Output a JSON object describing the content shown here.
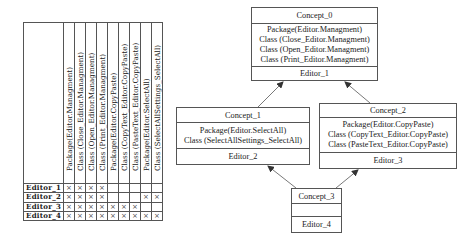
{
  "context_table": {
    "attributes": [
      "Package(Editor.Managment)",
      "Class (Close_Editor.Managment)",
      "Class (Open_Editor.Managment)",
      "Class (Print_Editor.Managment)",
      "Package(Editor.CopyPaste)",
      "Class (CopyText_Editor.CopyPaste)",
      "Class (PasteText_Editor.CopyPaste)",
      "Package(Editor.SelectAll)",
      "Class (SelectAllSettings_SelectAll)"
    ],
    "mark": "×",
    "rows": [
      {
        "object": "Editor_1",
        "cells": [
          "×",
          "×",
          "×",
          "×",
          "",
          "",
          "",
          "",
          ""
        ]
      },
      {
        "object": "Editor_2",
        "cells": [
          "×",
          "×",
          "×",
          "×",
          "",
          "",
          "",
          "×",
          "×"
        ]
      },
      {
        "object": "Editor_3",
        "cells": [
          "×",
          "×",
          "×",
          "×",
          "×",
          "×",
          "×",
          "",
          ""
        ]
      },
      {
        "object": "Editor_4",
        "cells": [
          "×",
          "×",
          "×",
          "×",
          "×",
          "×",
          "×",
          "×",
          "×"
        ]
      }
    ]
  },
  "lattice": {
    "concepts": [
      {
        "name": "Concept_0",
        "attributes": [
          "Package(Editor.Managment)",
          "Class (Close_Editor.Managment)",
          "Class (Open_Editor.Managment)",
          "Class (Print_Editor.Managment)"
        ],
        "objects": "Editor_1"
      },
      {
        "name": "Concept_1",
        "attributes": [
          "Package(Editor.SelectAll)",
          "Class (SelectAllSettings_SelectAll)"
        ],
        "objects": "Editor_2"
      },
      {
        "name": "Concept_2",
        "attributes": [
          "Package(Editor.CopyPaste)",
          "Class (CopyText_Editor.CopyPaste)",
          "Class (PasteText_Editor.CopyPaste)"
        ],
        "objects": "Editor_3"
      },
      {
        "name": "Concept_3",
        "attributes": [],
        "objects": "Editor_4"
      }
    ],
    "edges": [
      {
        "from": "Concept_1",
        "to": "Concept_0"
      },
      {
        "from": "Concept_2",
        "to": "Concept_0"
      },
      {
        "from": "Concept_3",
        "to": "Concept_1"
      },
      {
        "from": "Concept_3",
        "to": "Concept_2"
      }
    ]
  }
}
